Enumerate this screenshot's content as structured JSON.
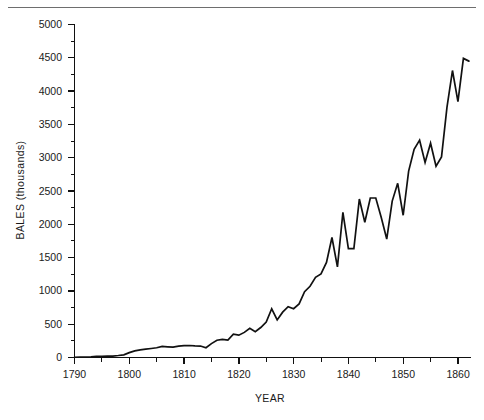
{
  "figure": {
    "background_color": "#ffffff",
    "line_color": "#111111",
    "axis_color": "#111111",
    "rule_color": "#6e6e6e"
  },
  "axes": {
    "x_title": "YEAR",
    "y_title": "BALES (thousands)",
    "x_tick_labels": [
      "1790",
      "1800",
      "1810",
      "1820",
      "1830",
      "1840",
      "1850",
      "1860"
    ],
    "y_tick_labels": [
      "0",
      "500",
      "1000",
      "1500",
      "2000",
      "2500",
      "3000",
      "3500",
      "4000",
      "4500",
      "5000"
    ]
  },
  "chart_data": {
    "type": "line",
    "title": "",
    "xlabel": "YEAR",
    "ylabel": "BALES (thousands)",
    "xlim": [
      1790,
      1862
    ],
    "ylim": [
      0,
      5000
    ],
    "xticks": [
      1790,
      1800,
      1810,
      1820,
      1830,
      1840,
      1850,
      1860
    ],
    "xticks_minor": [
      1795,
      1805,
      1815,
      1825,
      1835,
      1845,
      1855
    ],
    "yticks": [
      0,
      500,
      1000,
      1500,
      2000,
      2500,
      3000,
      3500,
      4000,
      4500,
      5000
    ],
    "yticks_minor": [
      250,
      750,
      1250,
      1750,
      2250,
      2750,
      3250,
      3750,
      4250,
      4750
    ],
    "grid": false,
    "legend": null,
    "series": [
      {
        "name": "Cotton production",
        "units": "thousands of bales",
        "x": [
          1790,
          1791,
          1792,
          1793,
          1794,
          1795,
          1796,
          1797,
          1798,
          1799,
          1800,
          1801,
          1802,
          1803,
          1804,
          1805,
          1806,
          1807,
          1808,
          1809,
          1810,
          1811,
          1812,
          1813,
          1814,
          1815,
          1816,
          1817,
          1818,
          1819,
          1820,
          1821,
          1822,
          1823,
          1824,
          1825,
          1826,
          1827,
          1828,
          1829,
          1830,
          1831,
          1832,
          1833,
          1834,
          1835,
          1836,
          1837,
          1838,
          1839,
          1840,
          1841,
          1842,
          1843,
          1844,
          1845,
          1846,
          1847,
          1848,
          1849,
          1850,
          1851,
          1852,
          1853,
          1854,
          1855,
          1856,
          1857,
          1858,
          1859,
          1860,
          1861,
          1862
        ],
        "y": [
          4,
          5,
          7,
          10,
          16,
          17,
          20,
          22,
          30,
          40,
          73,
          100,
          115,
          125,
          135,
          146,
          167,
          160,
          155,
          170,
          178,
          180,
          175,
          172,
          146,
          209,
          259,
          272,
          261,
          349,
          335,
          377,
          439,
          386,
          450,
          533,
          732,
          565,
          681,
          763,
          732,
          805,
          987,
          1070,
          1205,
          1255,
          1428,
          1802,
          1361,
          2178,
          1635,
          1635,
          2379,
          2030,
          2395,
          2395,
          2101,
          1779,
          2348,
          2615,
          2136,
          2799,
          3126,
          3263,
          2930,
          3218,
          2873,
          3012,
          3759,
          4309,
          3841,
          4491,
          4450
        ],
        "peak_value": 4491,
        "peak_year": 1861,
        "min_value": 4,
        "min_year": 1790
      }
    ]
  }
}
